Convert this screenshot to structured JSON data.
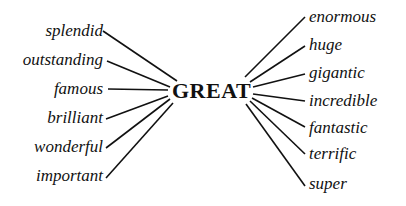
{
  "center": {
    "label": "GREAT"
  },
  "left_words": [
    {
      "label": "splendid",
      "y": 22
    },
    {
      "label": "outstanding",
      "y": 51
    },
    {
      "label": "famous",
      "y": 80
    },
    {
      "label": "brilliant",
      "y": 109
    },
    {
      "label": "wonderful",
      "y": 138
    },
    {
      "label": "important",
      "y": 167
    }
  ],
  "right_words": [
    {
      "label": "enormous",
      "y": 8
    },
    {
      "label": "huge",
      "y": 36
    },
    {
      "label": "gigantic",
      "y": 64
    },
    {
      "label": "incredible",
      "y": 92
    },
    {
      "label": "fantastic",
      "y": 119
    },
    {
      "label": "terrific",
      "y": 145
    },
    {
      "label": "super",
      "y": 175
    }
  ],
  "colors": {
    "text": "#111111",
    "background": "#ffffff"
  }
}
